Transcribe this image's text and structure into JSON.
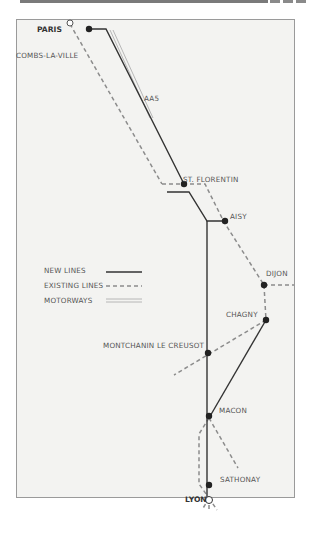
{
  "title_bar": {
    "decoration": "grey header rule with dashes"
  },
  "map": {
    "colors": {
      "background": "#f3f3f1",
      "new_lines": "#333333",
      "existing_lines": "#8c8c8c",
      "motorways": "#b0b0b0",
      "station": "#222222"
    },
    "stations": {
      "paris": "PARIS",
      "combs_la_ville": "COMBS-LA-VILLE",
      "st_florentin": "ST. FLORENTIN",
      "aisy": "AISY",
      "dijon": "DIJON",
      "chagny": "CHAGNY",
      "montchanin": "MONTCHANIN LE CREUSOT",
      "macon": "MACON",
      "sathonay": "SATHONAY",
      "lyon": "LYON"
    },
    "motorway_label": "AA5",
    "legend": {
      "new_lines": "NEW LINES",
      "existing_lines": "EXISTING LINES",
      "motorways": "MOTORWAYS"
    }
  }
}
